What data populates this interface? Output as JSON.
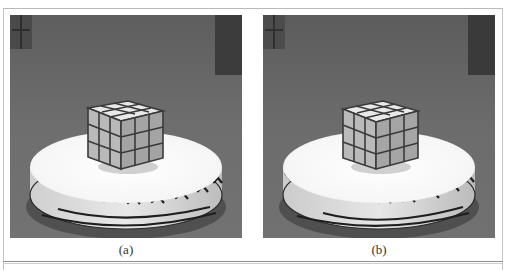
{
  "figure": {
    "panels": [
      {
        "id": "a",
        "caption": "(a)",
        "description": "Grayscale photo of a 3x3 Rubik's cube on a white circular turntable with a patterned rim"
      },
      {
        "id": "b",
        "caption": "(b)",
        "description": "Grayscale photo of a 3x3 Rubik's cube on a white circular turntable with a patterned rim, slightly different view"
      }
    ],
    "colors": {
      "background_gray": "#6f6f6f",
      "turntable_white": "#fbfbfb",
      "cube_face": "#b8b8b8",
      "cube_grid": "#3a3a3a",
      "rim_pattern": "#222222"
    }
  }
}
